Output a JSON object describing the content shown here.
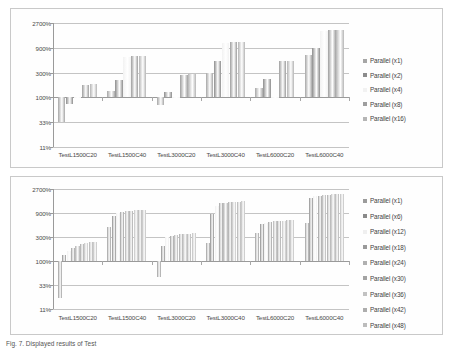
{
  "figure": {
    "caption": "Fig. 7. Displayed results of Test",
    "background": "#ffffff",
    "panel_border": "#c9c9c9"
  },
  "chart_data": [
    {
      "id": "top",
      "type": "bar",
      "title": "",
      "subtitle": "",
      "xlabel": "",
      "ylabel": "",
      "yscale": "log",
      "ylim": [
        11,
        2700
      ],
      "yticks": [
        11,
        33,
        100,
        300,
        900,
        2700
      ],
      "ytick_labels": [
        "11%",
        "33%",
        "100%",
        "300%",
        "900%",
        "2700%"
      ],
      "baseline": 100,
      "grid": true,
      "legend_position": "right",
      "categories": [
        "TestL1500C20",
        "TestL1500C40",
        "TestL3000C20",
        "TestL3000C40",
        "TestL6000C20",
        "TestL6000C40"
      ],
      "series": [
        {
          "name": "Parallel (x1)",
          "color": "#a6a6a6",
          "values": [
            33,
            130,
            70,
            290,
            150,
            650
          ]
        },
        {
          "name": "Parallel (x2)",
          "color": "#8c8c8c",
          "values": [
            75,
            215,
            125,
            500,
            225,
            900
          ]
        },
        {
          "name": "Parallel (x4)",
          "color": "#f2f2f2",
          "values": [
            100,
            600,
            100,
            1100,
            100,
            1900
          ]
        },
        {
          "name": "Parallel (x8)",
          "color": "#9e9e9e",
          "values": [
            175,
            620,
            270,
            1150,
            490,
            1950
          ]
        },
        {
          "name": "Parallel (x16)",
          "color": "#b5b5b5",
          "values": [
            178,
            630,
            280,
            1160,
            500,
            2000
          ]
        }
      ]
    },
    {
      "id": "bottom",
      "type": "bar",
      "title": "",
      "subtitle": "",
      "xlabel": "",
      "ylabel": "",
      "yscale": "log",
      "ylim": [
        11,
        2700
      ],
      "yticks": [
        11,
        33,
        100,
        300,
        900,
        2700
      ],
      "ytick_labels": [
        "11%",
        "33%",
        "100%",
        "300%",
        "900%",
        "2700%"
      ],
      "baseline": 100,
      "grid": true,
      "legend_position": "right",
      "categories": [
        "TestL1500C20",
        "TestL1500C40",
        "TestL3000C20",
        "TestL3000C40",
        "TestL6000C20",
        "TestL6000C40"
      ],
      "series": [
        {
          "name": "Parallel (x1)",
          "color": "#9b9b9b",
          "values": [
            18,
            470,
            48,
            230,
            360,
            560
          ]
        },
        {
          "name": "Parallel (x6)",
          "color": "#8a8a8a",
          "values": [
            130,
            800,
            195,
            870,
            540,
            1800
          ]
        },
        {
          "name": "Parallel (x12)",
          "color": "#efefef",
          "values": [
            160,
            900,
            300,
            1250,
            580,
            1950
          ]
        },
        {
          "name": "Parallel (x18)",
          "color": "#9a9a9a",
          "values": [
            180,
            950,
            320,
            1400,
            600,
            2000
          ]
        },
        {
          "name": "Parallel (x24)",
          "color": "#b0b0b0",
          "values": [
            200,
            980,
            330,
            1450,
            610,
            2050
          ]
        },
        {
          "name": "Parallel (x30)",
          "color": "#a3a3a3",
          "values": [
            215,
            1000,
            340,
            1480,
            620,
            2080
          ]
        },
        {
          "name": "Parallel (x36)",
          "color": "#c2c2c2",
          "values": [
            225,
            1020,
            345,
            1500,
            630,
            2100
          ]
        },
        {
          "name": "Parallel (x42)",
          "color": "#adadad",
          "values": [
            235,
            1030,
            350,
            1520,
            640,
            2120
          ]
        },
        {
          "name": "Parallel (x48)",
          "color": "#bcbcbc",
          "values": [
            240,
            1040,
            355,
            1530,
            645,
            2130
          ]
        }
      ]
    }
  ]
}
